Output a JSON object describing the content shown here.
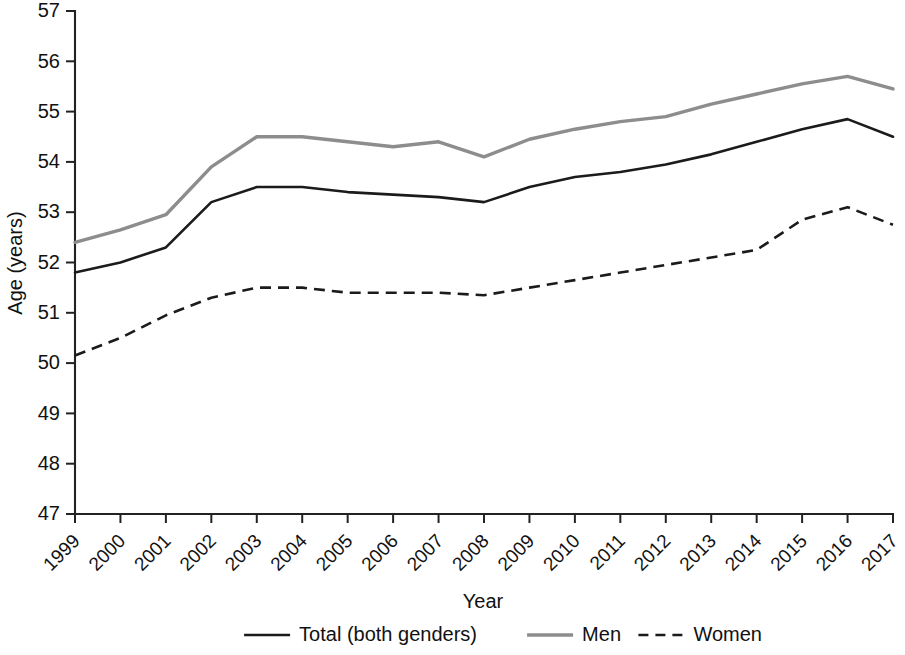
{
  "chart_data": {
    "type": "line",
    "title": "",
    "xlabel": "Year",
    "ylabel": "Age (years)",
    "xlim": [
      1999,
      2017
    ],
    "ylim": [
      47,
      57
    ],
    "grid": false,
    "legend_position": "bottom",
    "categories": [
      "1999",
      "2000",
      "2001",
      "2002",
      "2003",
      "2004",
      "2005",
      "2006",
      "2007",
      "2008",
      "2009",
      "2010",
      "2011",
      "2012",
      "2013",
      "2014",
      "2015",
      "2016",
      "2017"
    ],
    "x": [
      1999,
      2000,
      2001,
      2002,
      2003,
      2004,
      2005,
      2006,
      2007,
      2008,
      2009,
      2010,
      2011,
      2012,
      2013,
      2014,
      2015,
      2016,
      2017
    ],
    "ytick_labels": [
      "47",
      "48",
      "49",
      "50",
      "51",
      "52",
      "53",
      "54",
      "55",
      "56",
      "57"
    ],
    "yticks": [
      47,
      48,
      49,
      50,
      51,
      52,
      53,
      54,
      55,
      56,
      57
    ],
    "series": [
      {
        "name": "Total (both genders)",
        "style": "solid",
        "color": "#1b1b1b",
        "values": [
          51.8,
          52.0,
          52.3,
          53.2,
          53.5,
          53.5,
          53.4,
          53.35,
          53.3,
          53.2,
          53.5,
          53.7,
          53.8,
          53.95,
          54.15,
          54.4,
          54.65,
          54.85,
          54.5
        ]
      },
      {
        "name": "Men",
        "style": "solid",
        "color": "#8d8d8d",
        "values": [
          52.4,
          52.65,
          52.95,
          53.9,
          54.5,
          54.5,
          54.4,
          54.3,
          54.4,
          54.1,
          54.45,
          54.65,
          54.8,
          54.9,
          55.15,
          55.35,
          55.55,
          55.7,
          55.45
        ]
      },
      {
        "name": "Women",
        "style": "dashed",
        "color": "#1b1b1b",
        "values": [
          50.15,
          50.5,
          50.95,
          51.3,
          51.5,
          51.5,
          51.4,
          51.4,
          51.4,
          51.35,
          51.5,
          51.65,
          51.8,
          51.95,
          52.1,
          52.25,
          52.85,
          53.1,
          52.75
        ]
      }
    ]
  },
  "legend": {
    "items": [
      {
        "label": "Total (both genders)",
        "style": "solid",
        "color": "#1b1b1b"
      },
      {
        "label": "Men",
        "style": "solid",
        "color": "#8d8d8d"
      },
      {
        "label": "Women",
        "style": "dashed",
        "color": "#1b1b1b"
      }
    ]
  }
}
